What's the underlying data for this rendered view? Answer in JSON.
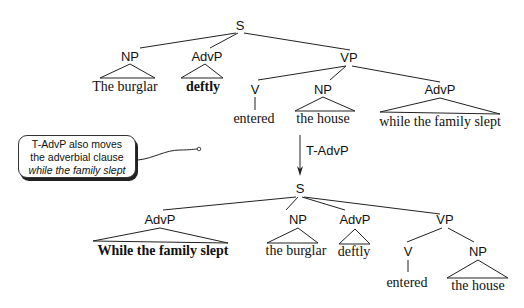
{
  "top_tree": {
    "root": "S",
    "np": "NP",
    "np_text": "The burglar",
    "advp": "AdvP",
    "advp_text": "deftly",
    "vp": "VP",
    "v": "V",
    "v_text": "entered",
    "vp_np": "NP",
    "vp_np_text": "the house",
    "vp_advp": "AdvP",
    "vp_advp_text": "while the family slept"
  },
  "transformation": {
    "label": "T-AdvP"
  },
  "callout": {
    "line1": "T-AdvP also moves",
    "line2": "the adverbial clause",
    "line3": "while the family slept"
  },
  "bottom_tree": {
    "root": "S",
    "advp": "AdvP",
    "advp_text": "While the family slept",
    "np": "NP",
    "np_text": "the burglar",
    "advp2": "AdvP",
    "advp2_text": "deftly",
    "vp": "VP",
    "v": "V",
    "v_text": "entered",
    "vp_np": "NP",
    "vp_np_text": "the house"
  }
}
